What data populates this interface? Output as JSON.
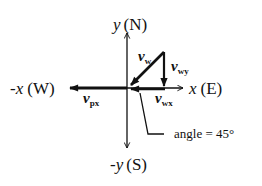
{
  "diagram": {
    "type": "vector-diagram",
    "axes": {
      "y_pos": {
        "var": "y",
        "dir": "(N)"
      },
      "y_neg": {
        "var": "-y",
        "dir": "(S)"
      },
      "x_pos": {
        "var": "x",
        "dir": "(E)"
      },
      "x_neg": {
        "var": "-x",
        "dir": "(W)"
      }
    },
    "vectors": {
      "v_w": {
        "base": "v",
        "sub": "w"
      },
      "v_wy": {
        "base": "v",
        "sub": "wy"
      },
      "v_wx": {
        "base": "v",
        "sub": "wx"
      },
      "v_px": {
        "base": "v",
        "sub": "px"
      }
    },
    "annotation": {
      "text": "angle = 45°"
    },
    "color": "#111111"
  }
}
